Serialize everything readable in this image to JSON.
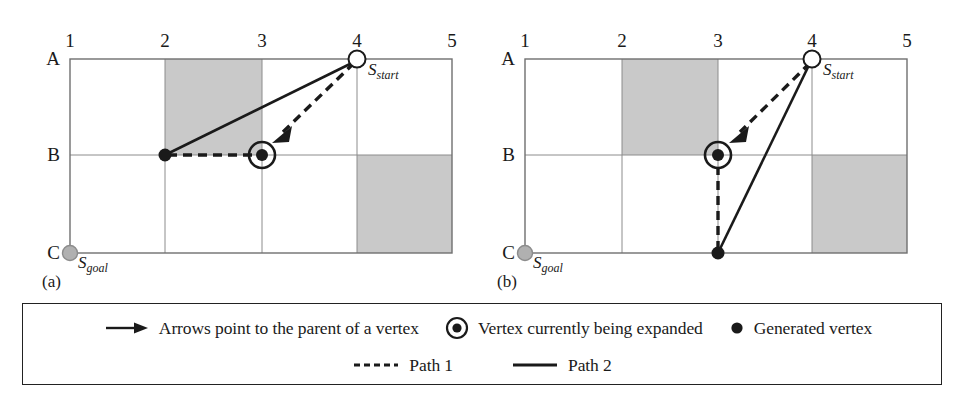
{
  "figure": {
    "panels": [
      {
        "id": "a",
        "caption": "(a)",
        "col_labels": [
          "1",
          "2",
          "3",
          "4",
          "5"
        ],
        "row_labels": [
          "A",
          "B",
          "C"
        ],
        "start_label": "S",
        "start_sub": "start",
        "goal_label": "S",
        "goal_sub": "goal",
        "start_cell": "4A",
        "goal_cell": "1C",
        "expanded_vertex_cell": "3B",
        "generated_vertex_cells": [
          "2B",
          "3B"
        ],
        "obstacles": [
          {
            "col_start": 2,
            "col_end": 3,
            "row_start": "A",
            "row_end": "B"
          },
          {
            "col_start": 4,
            "col_end": 5,
            "row_start": "B",
            "row_end": "C"
          }
        ],
        "path1_dashed": [
          "4A",
          "3B",
          "2B"
        ],
        "path2_solid": [
          "4A",
          "2B"
        ]
      },
      {
        "id": "b",
        "caption": "(b)",
        "col_labels": [
          "1",
          "2",
          "3",
          "4",
          "5"
        ],
        "row_labels": [
          "A",
          "B",
          "C"
        ],
        "start_label": "S",
        "start_sub": "start",
        "goal_label": "S",
        "goal_sub": "goal",
        "start_cell": "4A",
        "goal_cell": "1C",
        "expanded_vertex_cell": "3B",
        "generated_vertex_cells": [
          "3C"
        ],
        "obstacles": [
          {
            "col_start": 2,
            "col_end": 3,
            "row_start": "A",
            "row_end": "B"
          },
          {
            "col_start": 4,
            "col_end": 5,
            "row_start": "B",
            "row_end": "C"
          }
        ],
        "path1_dashed": [
          "4A",
          "3B",
          "3C"
        ],
        "path2_solid": [
          "4A",
          "3C"
        ]
      }
    ]
  },
  "legend": {
    "row1": [
      {
        "icon": "arrow-icon",
        "text": "Arrows point to the parent of a vertex"
      },
      {
        "icon": "expanded-vertex-icon",
        "text": "Vertex currently being expanded"
      },
      {
        "icon": "generated-vertex-icon",
        "text": "Generated vertex"
      }
    ],
    "row2": [
      {
        "icon": "dashed-line-icon",
        "text": "Path 1"
      },
      {
        "icon": "solid-line-icon",
        "text": "Path 2"
      }
    ]
  },
  "colors": {
    "obstacle_fill": "#c9c9c9",
    "grid_line": "#8c8c8c",
    "border": "#6f6f6f",
    "ink": "#1a1a1a",
    "goal_fill": "#b0b0b0",
    "start_fill": "#ffffff"
  }
}
